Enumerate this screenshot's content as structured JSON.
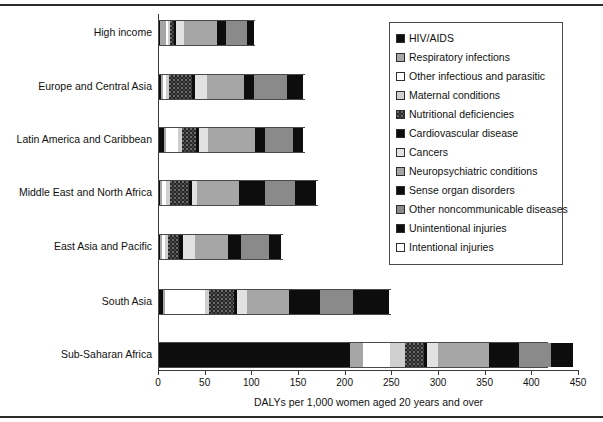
{
  "chart_data": {
    "type": "bar",
    "orientation": "horizontal",
    "stacked": true,
    "title": "",
    "xlabel": "DALYs per 1,000 women aged 20 years and over",
    "ylabel": "",
    "xlim": [
      0,
      450
    ],
    "xticks": [
      0,
      50,
      100,
      150,
      200,
      250,
      300,
      350,
      400,
      450
    ],
    "grid": false,
    "legend_position": "upper right",
    "categories": [
      "High income",
      "Europe and Central Asia",
      "Latin America and Caribbean",
      "Middle East and North Africa",
      "East Asia and Pacific",
      "South Asia",
      "Sub-Saharan Africa"
    ],
    "series": [
      {
        "name": "HIV/AIDS",
        "key": "hiv",
        "fill": "solid-black",
        "values": [
          1,
          2,
          5,
          1,
          1,
          4,
          205
        ]
      },
      {
        "name": "Respiratory infections",
        "key": "respiratory",
        "fill": "medium-gray",
        "values": [
          7,
          2,
          2,
          2,
          2,
          2,
          14
        ]
      },
      {
        "name": "Other infectious and parasitic",
        "key": "otherinf",
        "fill": "white",
        "values": [
          2,
          4,
          13,
          5,
          3,
          43,
          28
        ]
      },
      {
        "name": "Maternal conditions",
        "key": "maternal",
        "fill": "light-gray",
        "values": [
          2,
          3,
          5,
          4,
          4,
          5,
          17
        ]
      },
      {
        "name": "Nutritional deficiencies",
        "key": "nutrition",
        "fill": "speckled-dark",
        "values": [
          4,
          24,
          15,
          20,
          12,
          26,
          20
        ]
      },
      {
        "name": "Cardiovascular disease",
        "key": "cvd",
        "fill": "solid-black",
        "values": [
          2,
          4,
          3,
          3,
          4,
          4,
          3
        ]
      },
      {
        "name": "Cancers",
        "key": "cancers",
        "fill": "very-light",
        "values": [
          9,
          12,
          10,
          6,
          13,
          10,
          12
        ]
      },
      {
        "name": "Neuropsychiatric conditions",
        "key": "neuro",
        "fill": "medium-gray",
        "values": [
          35,
          40,
          50,
          45,
          35,
          45,
          55
        ]
      },
      {
        "name": "Sense organ disorders",
        "key": "sense",
        "fill": "solid-black",
        "values": [
          10,
          11,
          11,
          28,
          14,
          34,
          32
        ]
      },
      {
        "name": "Other noncommunicable diseases",
        "key": "othernoncom",
        "fill": "dark-gray",
        "values": [
          22,
          35,
          30,
          32,
          30,
          35,
          34
        ]
      },
      {
        "name": "Unintentional injuries",
        "key": "unintent",
        "fill": "solid-black",
        "values": [
          8,
          17,
          10,
          22,
          13,
          38,
          24
        ]
      },
      {
        "name": "Intentional injuries",
        "key": "intent",
        "fill": "white",
        "values": [
          2,
          3,
          3,
          3,
          3,
          4,
          4
        ]
      }
    ],
    "totals": [
      104,
      157,
      157,
      171,
      134,
      250,
      418
    ]
  },
  "axis": {
    "tick_labels": [
      "0",
      "50",
      "100",
      "150",
      "200",
      "250",
      "300",
      "350",
      "400",
      "450"
    ],
    "x_title": "DALYs per 1,000 women aged 20 years and over"
  },
  "legend": {
    "items": [
      {
        "label": "HIV/AIDS",
        "swatch": "solid-black-swatch"
      },
      {
        "label": "Respiratory infections",
        "swatch": "medium-gray-swatch"
      },
      {
        "label": "Other infectious and parasitic",
        "swatch": "white-swatch"
      },
      {
        "label": "Maternal conditions",
        "swatch": "light-gray-swatch"
      },
      {
        "label": "Nutritional deficiencies",
        "swatch": "speckled-dark-swatch"
      },
      {
        "label": "Cardiovascular disease",
        "swatch": "solid-black-swatch"
      },
      {
        "label": "Cancers",
        "swatch": "very-light-swatch"
      },
      {
        "label": "Neuropsychiatric conditions",
        "swatch": "medium-gray-swatch"
      },
      {
        "label": "Sense organ disorders",
        "swatch": "solid-black-swatch"
      },
      {
        "label": "Other noncommunicable diseases",
        "swatch": "dark-gray-swatch"
      },
      {
        "label": "Unintentional injuries",
        "swatch": "solid-black-swatch"
      },
      {
        "label": "Intentional injuries",
        "swatch": "white-swatch"
      }
    ]
  },
  "colors": {
    "solid-black": "#0d0d0d",
    "white": "#ffffff",
    "light-gray": "#cfcfcf",
    "medium-gray": "#a6a6a6",
    "dark-gray": "#8a8a8a",
    "very-light": "#e2e2e2",
    "speckled-dark": "#262626",
    "axis": "#3a3a3a"
  }
}
